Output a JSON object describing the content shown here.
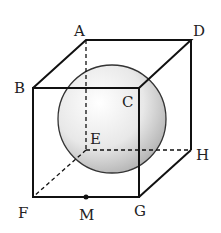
{
  "diagram": {
    "type": "cube-with-inscribed-sphere",
    "labels": {
      "A": "A",
      "B": "B",
      "C": "C",
      "D": "D",
      "E": "E",
      "F": "F",
      "G": "G",
      "H": "H",
      "M": "M"
    },
    "colors": {
      "edge": "#111111",
      "sphere_light": "#ffffff",
      "sphere_dark": "#b8b8b8",
      "sphere_outline": "#333333"
    }
  }
}
